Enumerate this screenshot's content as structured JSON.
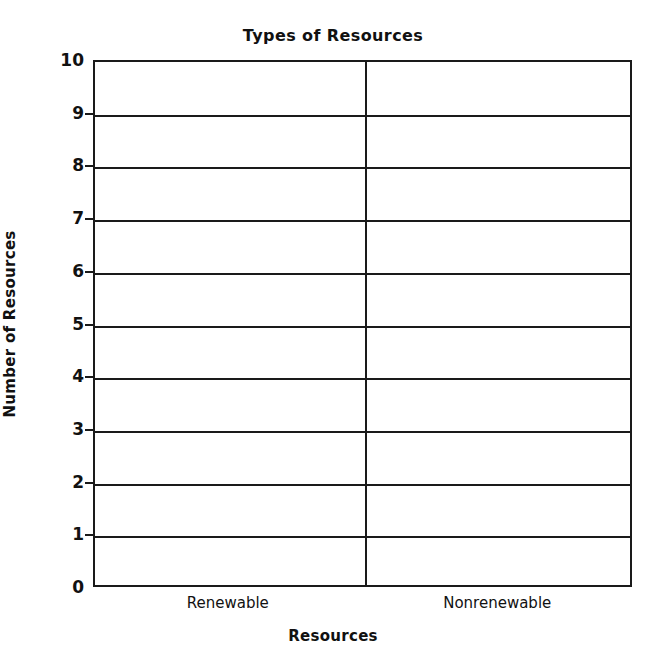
{
  "chart_data": {
    "type": "bar",
    "title": "Types of Resources",
    "xlabel": "Resources",
    "ylabel": "Number of Resources",
    "categories": [
      "Renewable",
      "Nonrenewable"
    ],
    "values": [
      null,
      null
    ],
    "ylim": [
      0,
      10
    ],
    "ytick_step": 1,
    "ytick_labels": [
      "10",
      "9",
      "8",
      "7",
      "6",
      "5",
      "4",
      "3",
      "2",
      "1",
      "0"
    ],
    "grid": true,
    "grid_orientation": "horizontal",
    "legend": null,
    "legend_position": "none",
    "series": [
      {
        "name": "Number of Resources",
        "values": [
          null,
          null
        ]
      }
    ],
    "annotations": [],
    "note": "Blank worksheet bar-chart template; no bars are plotted.",
    "colors": {
      "axis": "#1a1a1a",
      "grid": "#1a1a1a",
      "background": "#ffffff",
      "text": "#111111"
    }
  },
  "chart": {
    "title": "Types of Resources",
    "yaxis_title": "Number of Resources",
    "xaxis_title": "Resources",
    "ytick_labels": [
      "10",
      "9",
      "8",
      "7",
      "6",
      "5",
      "4",
      "3",
      "2",
      "1",
      "0"
    ],
    "category_labels": [
      "Renewable",
      "Nonrenewable"
    ]
  }
}
